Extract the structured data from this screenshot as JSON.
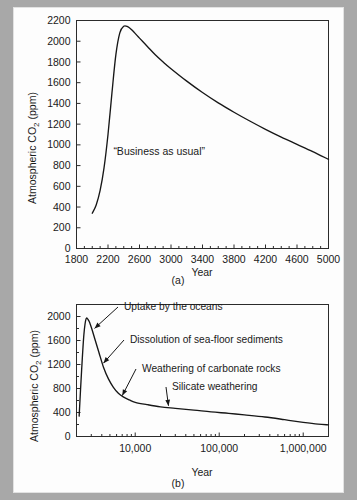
{
  "figure": {
    "background_color": "#a8a8a8",
    "panel_color": "#fdfdfd",
    "line_color": "#171717"
  },
  "panel_a": {
    "caption": "(a)",
    "xlabel": "Year",
    "ylabel_prefix": "Atmospheric CO",
    "ylabel_sub": "2",
    "ylabel_suffix": " (ppm)",
    "inner_note": "“Business as usual”",
    "xticks": [
      "1800",
      "2200",
      "2600",
      "3000",
      "3400",
      "3800",
      "4200",
      "4600",
      "5000"
    ],
    "yticks": [
      "0",
      "200",
      "400",
      "600",
      "800",
      "1000",
      "1200",
      "1400",
      "1600",
      "1800",
      "2000",
      "2200"
    ]
  },
  "panel_b": {
    "caption": "(b)",
    "xlabel": "Year",
    "ylabel_prefix": "Atmospheric CO",
    "ylabel_sub": "2",
    "ylabel_suffix": " (ppm)",
    "xticks": [
      "10,000",
      "100,000",
      "1,000,000"
    ],
    "yticks": [
      "0",
      "400",
      "800",
      "1200",
      "1600",
      "2000"
    ],
    "annotations": [
      {
        "text": "Uptake by the oceans"
      },
      {
        "text": "Dissolution of sea-floor sediments"
      },
      {
        "text": "Weathering of carbonate rocks"
      },
      {
        "text": "Silicate weathering"
      }
    ]
  },
  "chart_data": [
    {
      "type": "line",
      "id": "panel-a",
      "title": "",
      "xlabel": "Year",
      "ylabel": "Atmospheric CO2 (ppm)",
      "xlim": [
        1800,
        5000
      ],
      "ylim": [
        0,
        2200
      ],
      "xscale": "linear",
      "yscale": "linear",
      "xticks": [
        1800,
        2200,
        2600,
        3000,
        3400,
        3800,
        4200,
        4600,
        5000
      ],
      "yticks": [
        0,
        200,
        400,
        600,
        800,
        1000,
        1200,
        1400,
        1600,
        1800,
        2000,
        2200
      ],
      "grid": false,
      "legend": "none",
      "annotations": [
        {
          "text": "“Business as usual”",
          "x": 2850,
          "y": 900
        }
      ],
      "series": [
        {
          "name": "Business as usual CO2",
          "x": [
            2000,
            2050,
            2100,
            2150,
            2200,
            2250,
            2300,
            2350,
            2400,
            2450,
            2500,
            2600,
            2700,
            2800,
            2900,
            3000,
            3200,
            3400,
            3600,
            3800,
            4000,
            4200,
            4400,
            4600,
            4800,
            5000
          ],
          "values": [
            340,
            420,
            560,
            780,
            1100,
            1500,
            1870,
            2080,
            2145,
            2140,
            2110,
            2030,
            1950,
            1870,
            1800,
            1735,
            1615,
            1505,
            1405,
            1315,
            1230,
            1150,
            1075,
            1005,
            935,
            860
          ]
        }
      ]
    },
    {
      "type": "line",
      "id": "panel-b",
      "title": "",
      "xlabel": "Year",
      "ylabel": "Atmospheric CO2 (ppm)",
      "xlim": [
        2000,
        2000000
      ],
      "ylim": [
        0,
        2200
      ],
      "xscale": "log",
      "yscale": "linear",
      "xticks": [
        10000,
        100000,
        1000000
      ],
      "yticks": [
        0,
        400,
        800,
        1200,
        1600,
        2000
      ],
      "grid": false,
      "legend": "none",
      "annotations": [
        {
          "text": "Uptake by the oceans",
          "point_x": 2900,
          "point_y": 1760
        },
        {
          "text": "Dissolution of sea-floor sediments",
          "point_x": 3700,
          "point_y": 1180
        },
        {
          "text": "Weathering of carbonate rocks",
          "point_x": 6200,
          "point_y": 640
        },
        {
          "text": "Silicate weathering",
          "point_x": 22000,
          "point_y": 470
        }
      ],
      "series": [
        {
          "name": "Atmospheric CO2 decay",
          "x": [
            2150,
            2300,
            2450,
            2600,
            2800,
            3000,
            3300,
            3700,
            4200,
            4800,
            5500,
            6300,
            7200,
            8500,
            10000,
            14000,
            20000,
            30000,
            50000,
            80000,
            130000,
            200000,
            350000,
            600000,
            1000000,
            1500000,
            2000000
          ],
          "values": [
            340,
            1100,
            1700,
            1960,
            1930,
            1820,
            1630,
            1400,
            1150,
            960,
            820,
            720,
            660,
            610,
            570,
            530,
            495,
            470,
            440,
            410,
            385,
            360,
            325,
            280,
            235,
            205,
            195
          ]
        }
      ]
    }
  ]
}
